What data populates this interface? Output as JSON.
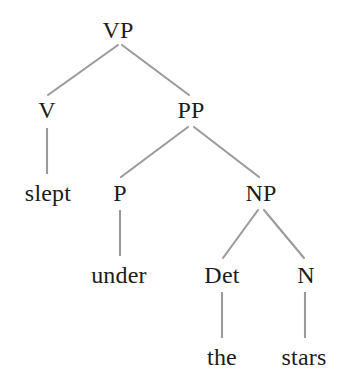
{
  "figure": {
    "kind": "syntax-tree",
    "sentence": "slept under the stars",
    "background_color": "#ffffff",
    "edge_color": "#9b9b9b",
    "text_color": "#1c1c1c"
  },
  "nodes": {
    "vp": {
      "label": "VP",
      "x": 118,
      "y": 17,
      "type": "phrasal"
    },
    "v": {
      "label": "V",
      "x": 47,
      "y": 97,
      "type": "preterminal"
    },
    "pp": {
      "label": "PP",
      "x": 191,
      "y": 97,
      "type": "phrasal"
    },
    "slept": {
      "label": "slept",
      "x": 48,
      "y": 180,
      "type": "terminal"
    },
    "p": {
      "label": "P",
      "x": 120,
      "y": 180,
      "type": "preterminal"
    },
    "np": {
      "label": "NP",
      "x": 261,
      "y": 180,
      "type": "phrasal"
    },
    "under": {
      "label": "under",
      "x": 119,
      "y": 262,
      "type": "terminal"
    },
    "det": {
      "label": "Det",
      "x": 222,
      "y": 262,
      "type": "preterminal"
    },
    "n": {
      "label": "N",
      "x": 306,
      "y": 262,
      "type": "preterminal"
    },
    "the": {
      "label": "the",
      "x": 222,
      "y": 344,
      "type": "terminal"
    },
    "stars": {
      "label": "stars",
      "x": 304,
      "y": 344,
      "type": "terminal"
    }
  },
  "edges": [
    {
      "name": "vp-to-v",
      "from": "VP",
      "to": "V",
      "x1": 118,
      "y1": 45,
      "x2": 48,
      "y2": 95
    },
    {
      "name": "vp-to-pp",
      "from": "VP",
      "to": "PP",
      "x1": 122,
      "y1": 45,
      "x2": 189,
      "y2": 95
    },
    {
      "name": "v-to-slept",
      "from": "V",
      "to": "slept",
      "x1": 47,
      "y1": 128,
      "x2": 47,
      "y2": 174
    },
    {
      "name": "pp-to-p",
      "from": "PP",
      "to": "P",
      "x1": 188,
      "y1": 127,
      "x2": 121,
      "y2": 177
    },
    {
      "name": "pp-to-np",
      "from": "PP",
      "to": "NP",
      "x1": 194,
      "y1": 127,
      "x2": 259,
      "y2": 177
    },
    {
      "name": "p-to-under",
      "from": "P",
      "to": "under",
      "x1": 120,
      "y1": 210,
      "x2": 120,
      "y2": 256
    },
    {
      "name": "np-to-det",
      "from": "NP",
      "to": "Det",
      "x1": 258,
      "y1": 210,
      "x2": 223,
      "y2": 258
    },
    {
      "name": "np-to-n",
      "from": "NP",
      "to": "N",
      "x1": 264,
      "y1": 210,
      "x2": 304,
      "y2": 258
    },
    {
      "name": "det-to-the",
      "from": "Det",
      "to": "the",
      "x1": 222,
      "y1": 292,
      "x2": 222,
      "y2": 338
    },
    {
      "name": "n-to-stars",
      "from": "N",
      "to": "stars",
      "x1": 305,
      "y1": 292,
      "x2": 305,
      "y2": 338
    }
  ]
}
